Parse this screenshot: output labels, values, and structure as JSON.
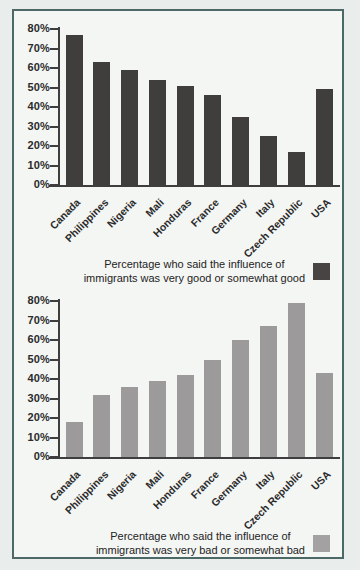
{
  "chart_data": [
    {
      "type": "bar",
      "title": "",
      "xlabel": "",
      "ylabel": "",
      "categories": [
        "Canada",
        "Philippines",
        "Nigeria",
        "Mali",
        "Honduras",
        "France",
        "Germany",
        "Italy",
        "Czech Republic",
        "USA"
      ],
      "values": [
        77,
        63,
        59,
        54,
        51,
        46,
        35,
        25,
        17,
        49
      ],
      "ylim": [
        0,
        80
      ],
      "tick_step": 10,
      "tick_suffix": "%",
      "grid": false,
      "bar_color": "#403d3d",
      "legend": {
        "position": "bottom-right",
        "line1": "Percentage who said the influence of",
        "line2": "immigrants was very good or somewhat good",
        "swatch_color": "#474443"
      }
    },
    {
      "type": "bar",
      "title": "",
      "xlabel": "",
      "ylabel": "",
      "categories": [
        "Canada",
        "Philippines",
        "Nigeria",
        "Mali",
        "Honduras",
        "France",
        "Germany",
        "Italy",
        "Czech Republic",
        "USA"
      ],
      "values": [
        18,
        32,
        36,
        39,
        42,
        50,
        60,
        67,
        79,
        43
      ],
      "ylim": [
        0,
        80
      ],
      "tick_step": 10,
      "tick_suffix": "%",
      "grid": false,
      "bar_color": "#9c9a9a",
      "legend": {
        "position": "bottom-right",
        "line1": "Percentage who said the influence of",
        "line2": "immigrants was very bad or somewhat bad",
        "swatch_color": "#a3a1a1"
      }
    }
  ],
  "colors": {
    "page_bg": "#e9edeb",
    "frame_bg": "#f4f6f4",
    "frame_border": "#4c6968",
    "axis": "#3e3e3e",
    "text": "#2b2b2b"
  }
}
